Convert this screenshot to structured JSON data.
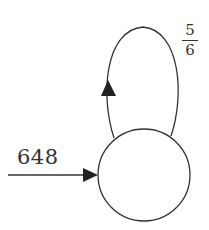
{
  "diagram": {
    "type": "state-transition",
    "node": {
      "label": ""
    },
    "incoming_edge": {
      "label": "648"
    },
    "self_loop": {
      "numerator": "5",
      "denominator": "6"
    },
    "colors": {
      "stroke": "#333333",
      "background": "#ffffff"
    }
  }
}
